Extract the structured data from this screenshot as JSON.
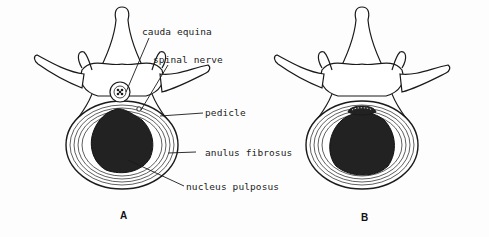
{
  "figure": {
    "panels": [
      {
        "id": "A",
        "label": "A"
      },
      {
        "id": "B",
        "label": "B"
      }
    ],
    "labels": {
      "cauda_equina": "cauda equina",
      "spinal_nerve": "spinal nerve",
      "pedicle": "pedicle",
      "anulus_fibrosus": "anulus fibrosus",
      "nucleus_pulposus": "nucleus pulposus"
    },
    "colors": {
      "ink": "#1a1a1a",
      "nucleus_fill": "#222222",
      "background": "#fdfdfd"
    }
  }
}
